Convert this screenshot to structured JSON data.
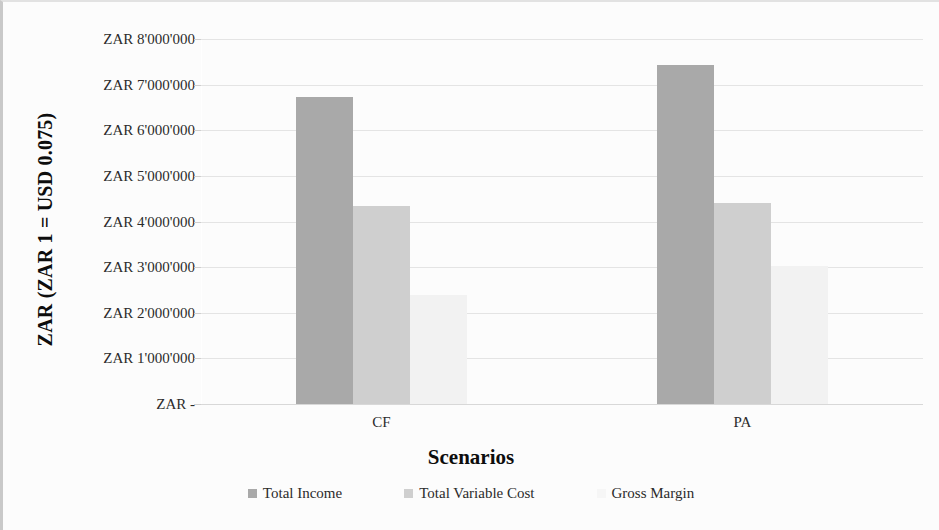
{
  "chart_data": {
    "type": "bar",
    "title": "",
    "categories": [
      "CF",
      "PA"
    ],
    "series": [
      {
        "name": "Total Income",
        "values": [
          6730000,
          7430000
        ],
        "color": "#a9a9a9"
      },
      {
        "name": "Total Variable Cost",
        "values": [
          4330000,
          4400000
        ],
        "color": "#cfcfcf"
      },
      {
        "name": "Gross Margin",
        "values": [
          2400000,
          3030000
        ],
        "color": "#f2f2f2"
      }
    ],
    "xlabel": "Scenarios",
    "ylabel": "ZAR (ZAR 1 = USD 0.075)",
    "ylim": [
      0,
      8000000
    ],
    "ytick_values": [
      0,
      1000000,
      2000000,
      3000000,
      4000000,
      5000000,
      6000000,
      7000000,
      8000000
    ],
    "ytick_labels": [
      "ZAR -",
      "ZAR 1'000'000",
      "ZAR 2'000'000",
      "ZAR 3'000'000",
      "ZAR 4'000'000",
      "ZAR 5'000'000",
      "ZAR 6'000'000",
      "ZAR 7'000'000",
      "ZAR 8'000'000"
    ],
    "grid": true,
    "legend_position": "bottom",
    "bar_gap_within_group": 0,
    "currency_note": "ZAR 1 = USD 0.075"
  }
}
